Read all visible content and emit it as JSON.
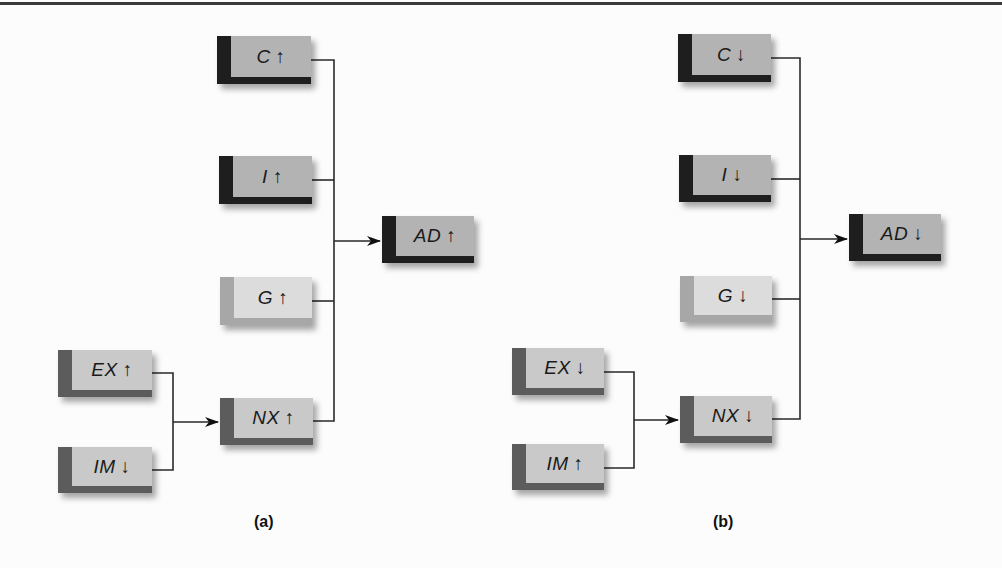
{
  "figure": {
    "panels": [
      {
        "id": "a",
        "label": "(a)",
        "boxes": [
          {
            "key": "C",
            "text": "C",
            "arrow": "↑",
            "style": "dark"
          },
          {
            "key": "I",
            "text": "I",
            "arrow": "↑",
            "style": "dark"
          },
          {
            "key": "G",
            "text": "G",
            "arrow": "↑",
            "style": "light"
          },
          {
            "key": "NX",
            "text": "NX",
            "arrow": "↑",
            "style": "medium"
          },
          {
            "key": "EX",
            "text": "EX",
            "arrow": "↑",
            "style": "medium"
          },
          {
            "key": "IM",
            "text": "IM",
            "arrow": "↓",
            "style": "medium"
          },
          {
            "key": "AD",
            "text": "AD",
            "arrow": "↑",
            "style": "dark"
          }
        ]
      },
      {
        "id": "b",
        "label": "(b)",
        "boxes": [
          {
            "key": "C",
            "text": "C",
            "arrow": "↓",
            "style": "dark"
          },
          {
            "key": "I",
            "text": "I",
            "arrow": "↓",
            "style": "dark"
          },
          {
            "key": "G",
            "text": "G",
            "arrow": "↓",
            "style": "light"
          },
          {
            "key": "NX",
            "text": "NX",
            "arrow": "↓",
            "style": "medium"
          },
          {
            "key": "EX",
            "text": "EX",
            "arrow": "↓",
            "style": "medium"
          },
          {
            "key": "IM",
            "text": "IM",
            "arrow": "↑",
            "style": "medium"
          },
          {
            "key": "AD",
            "text": "AD",
            "arrow": "↓",
            "style": "dark"
          }
        ]
      }
    ],
    "colors": {
      "dark_strip": "#1e1e1e",
      "dark_face": "#b3b3b3",
      "medium_strip": "#5c5c5c",
      "medium_face": "#c9c9c9",
      "light_strip": "#a7a7a7",
      "light_face": "#dcdcdc",
      "line": "#2a2a2a"
    }
  }
}
